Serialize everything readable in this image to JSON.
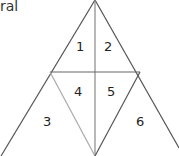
{
  "caption": "ral",
  "regions": [
    {
      "id": "r1",
      "label": "1",
      "x": 76,
      "y": 40
    },
    {
      "id": "r2",
      "label": "2",
      "x": 104,
      "y": 40
    },
    {
      "id": "r3",
      "label": "3",
      "x": 43,
      "y": 115
    },
    {
      "id": "r4",
      "label": "4",
      "x": 74,
      "y": 85
    },
    {
      "id": "r5",
      "label": "5",
      "x": 107,
      "y": 85
    },
    {
      "id": "r6",
      "label": "6",
      "x": 136,
      "y": 115
    }
  ],
  "colors": {
    "line": "#555555",
    "inner_line": "#999999"
  }
}
